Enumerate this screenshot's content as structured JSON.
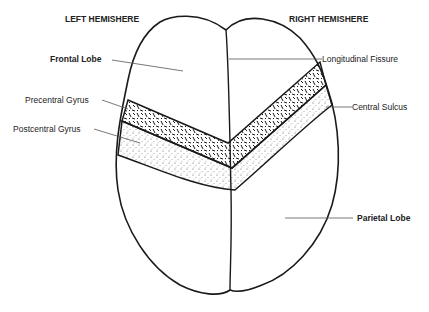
{
  "diagram": {
    "headers": {
      "left": "LEFT HEMISHERE",
      "right": "RIGHT HEMISHERE"
    },
    "labels": {
      "frontal_lobe": "Frontal Lobe",
      "longitudinal_fissure": "Longitudinal Fissure",
      "precentral_gyrus": "Precentral Gyrus",
      "central_sulcus": "Central Sulcus",
      "postcentral_gyrus": "Postcentral Gyrus",
      "parietal_lobe": "Parietal Lobe"
    },
    "colors": {
      "outline": "#1a1a1a",
      "leader": "#555555",
      "background": "#ffffff"
    }
  }
}
